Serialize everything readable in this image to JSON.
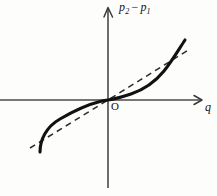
{
  "figure": {
    "kind": "math-graph",
    "background_color": "#fdfdfc",
    "width": 217,
    "height": 196,
    "labels": {
      "y_axis_symbol_1": "p",
      "y_axis_subscript_1": "2",
      "y_axis_operator": "−",
      "y_axis_symbol_2": "p",
      "y_axis_subscript_2": "1",
      "x_axis": "q",
      "origin": "O"
    },
    "colors": {
      "axis": "#4a4a4a",
      "curve": "#111111",
      "dashed_line": "#2b2b2b"
    }
  },
  "chart_data": {
    "type": "line",
    "title": "",
    "xlabel": "q",
    "ylabel": "p2 − p1",
    "origin_label": "O",
    "grid": false,
    "legend": null,
    "axes": {
      "x_axis_y_pixel": 100,
      "y_axis_x_pixel": 108,
      "x_range_pixels": [
        0,
        200
      ],
      "y_range_pixels": [
        8,
        188
      ],
      "x_arrow": true,
      "y_arrow": true,
      "tick_labels_x": [],
      "tick_labels_y": []
    },
    "series": [
      {
        "name": "p2 − p1 (actual, cubic S-curve)",
        "style": "solid",
        "color": "#111111",
        "points": [
          [
            40,
            152
          ],
          [
            44,
            142
          ],
          [
            52,
            131
          ],
          [
            62,
            121
          ],
          [
            74,
            112
          ],
          [
            88,
            105
          ],
          [
            100,
            101
          ],
          [
            108,
            100
          ],
          [
            118,
            98
          ],
          [
            132,
            94
          ],
          [
            146,
            88
          ],
          [
            158,
            79
          ],
          [
            168,
            67
          ],
          [
            176,
            55
          ],
          [
            182,
            44
          ],
          [
            185,
            40
          ]
        ]
      },
      {
        "name": "linear reference (dashed)",
        "style": "dashed",
        "color": "#2b2b2b",
        "points": [
          [
            30,
            148
          ],
          [
            108,
            100
          ],
          [
            190,
            49
          ]
        ]
      }
    ],
    "annotations": [
      {
        "text": "p2 − p1",
        "position": "y-axis-top",
        "x": 119,
        "y": 1
      },
      {
        "text": "q",
        "position": "x-axis-right",
        "x": 205,
        "y": 101
      },
      {
        "text": "O",
        "position": "origin",
        "x": 111,
        "y": 101
      }
    ]
  }
}
